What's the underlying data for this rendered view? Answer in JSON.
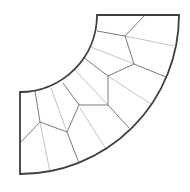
{
  "diagram": {
    "type": "annular-sector-mesh",
    "colors": {
      "boundary": "#3e3e3e",
      "edge_dark": "#7a7a7a",
      "edge_light": "#c4c4c4",
      "background": "#ffffff"
    },
    "sector": {
      "center": [
        20,
        15
      ],
      "inner_radius": 77,
      "outer_radius": 159,
      "start_angle_deg": 0,
      "end_angle_deg": 90
    },
    "vertices": {
      "V1": [
        125,
        36
      ],
      "V2": [
        134,
        64
      ],
      "V3": [
        108,
        76
      ],
      "V4": [
        108,
        105
      ],
      "V5": [
        79,
        105
      ],
      "V6": [
        40,
        122
      ],
      "V7": [
        67,
        132
      ]
    },
    "edges_dark": [
      [
        [
          145,
          15
        ],
        [
          125,
          36
        ]
      ],
      [
        [
          97,
          31
        ],
        [
          125,
          36
        ]
      ],
      [
        [
          125,
          36
        ],
        [
          134,
          64
        ]
      ],
      [
        [
          134,
          64
        ],
        [
          166,
          77
        ]
      ],
      [
        [
          83,
          57
        ],
        [
          108,
          76
        ]
      ],
      [
        [
          108,
          76
        ],
        [
          134,
          64
        ]
      ],
      [
        [
          108,
          76
        ],
        [
          108,
          105
        ]
      ],
      [
        [
          108,
          105
        ],
        [
          129,
          128
        ]
      ],
      [
        [
          79,
          105
        ],
        [
          108,
          105
        ]
      ],
      [
        [
          63,
          83
        ],
        [
          79,
          105
        ]
      ],
      [
        [
          79,
          105
        ],
        [
          67,
          132
        ]
      ],
      [
        [
          67,
          132
        ],
        [
          79,
          163
        ]
      ],
      [
        [
          35,
          91
        ],
        [
          40,
          122
        ]
      ],
      [
        [
          40,
          122
        ],
        [
          20,
          143
        ]
      ],
      [
        [
          40,
          122
        ],
        [
          67,
          132
        ]
      ]
    ],
    "edges_light": [
      [
        [
          125,
          36
        ],
        [
          174,
          46
        ]
      ],
      [
        [
          91,
          47
        ],
        [
          134,
          64
        ]
      ],
      [
        [
          74,
          69
        ],
        [
          108,
          105
        ]
      ],
      [
        [
          108,
          76
        ],
        [
          151,
          104
        ]
      ],
      [
        [
          80,
          108
        ],
        [
          106,
          149
        ]
      ],
      [
        [
          51,
          88
        ],
        [
          67,
          132
        ]
      ],
      [
        [
          40,
          122
        ],
        [
          50,
          172
        ]
      ]
    ]
  }
}
